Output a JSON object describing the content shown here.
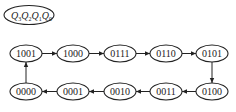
{
  "diagram": {
    "type": "state-transition-diagram",
    "legend": {
      "label": "Q3Q2Q1Q0",
      "parts": [
        {
          "var": "Q",
          "sub": "3"
        },
        {
          "var": "Q",
          "sub": "2"
        },
        {
          "var": "Q",
          "sub": "1"
        },
        {
          "var": "Q",
          "sub": "0"
        }
      ]
    },
    "states": [
      {
        "id": "s1001",
        "label": "1001"
      },
      {
        "id": "s1000",
        "label": "1000"
      },
      {
        "id": "s0111",
        "label": "0111"
      },
      {
        "id": "s0110",
        "label": "0110"
      },
      {
        "id": "s0101",
        "label": "0101"
      },
      {
        "id": "s0100",
        "label": "0100"
      },
      {
        "id": "s0011",
        "label": "0011"
      },
      {
        "id": "s0010",
        "label": "0010"
      },
      {
        "id": "s0001",
        "label": "0001"
      },
      {
        "id": "s0000",
        "label": "0000"
      }
    ],
    "transitions": [
      {
        "from": "1001",
        "to": "1000"
      },
      {
        "from": "1000",
        "to": "0111"
      },
      {
        "from": "0111",
        "to": "0110"
      },
      {
        "from": "0110",
        "to": "0101"
      },
      {
        "from": "0101",
        "to": "0100"
      },
      {
        "from": "0100",
        "to": "0011"
      },
      {
        "from": "0011",
        "to": "0010"
      },
      {
        "from": "0010",
        "to": "0001"
      },
      {
        "from": "0001",
        "to": "0000"
      },
      {
        "from": "0000",
        "to": "1001"
      }
    ],
    "colors": {
      "stroke": "#222222",
      "background": "#ffffff"
    }
  }
}
